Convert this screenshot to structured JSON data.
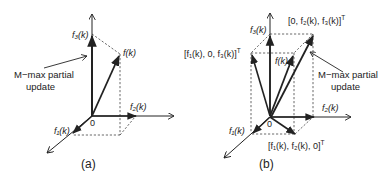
{
  "figure": {
    "panel_a": {
      "caption": "(a)",
      "labels": {
        "f3": "f₃(k)",
        "f2": "f₂(k)",
        "f1": "f₁(k)",
        "fk": "f(k)",
        "origin": "0"
      },
      "annotation_line1": "M−max partial",
      "annotation_line2": "update"
    },
    "panel_b": {
      "caption": "(b)",
      "labels": {
        "f3": "f₃(k)",
        "f2": "f₂(k)",
        "f1": "f₁(k)",
        "fk": "f(k)",
        "origin": "0",
        "top_right": "[0, f₂(k), f₃(k)]",
        "top_left": "[f₁(k), 0, f₃(k)]",
        "bottom": "[f₁(k), f₂(k), 0]",
        "transpose": "T"
      },
      "annotation_line1": "M−max partial",
      "annotation_line2": "update"
    },
    "colors": {
      "stroke": "#222222",
      "background": "#ffffff"
    }
  }
}
